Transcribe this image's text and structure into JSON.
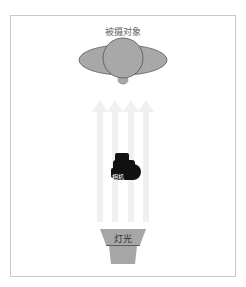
{
  "diagram": {
    "type": "lighting-setup",
    "subject": {
      "label": "被摄对象"
    },
    "camera": {
      "label": "相机"
    },
    "light": {
      "label": "灯光"
    },
    "arrows": {
      "count": 4,
      "direction": "up"
    },
    "colors": {
      "frame": "#c8c8c8",
      "subject_fill": "#a8a8a8",
      "subject_stroke": "#555555",
      "camera": "#111111",
      "light_fill": "#a6a6a6",
      "arrow": "#f0f0f0"
    }
  }
}
